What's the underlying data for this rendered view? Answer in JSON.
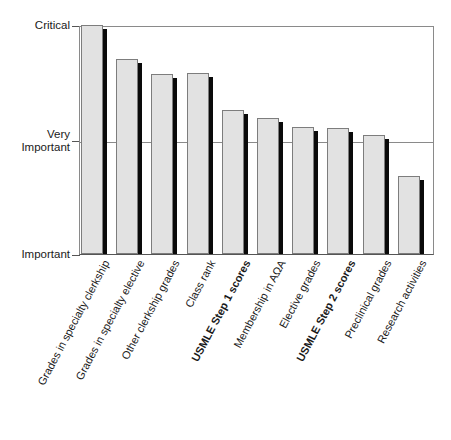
{
  "chart_data": {
    "type": "bar",
    "title": "",
    "subtitle": "",
    "xlabel": "",
    "ylabel": "",
    "grid": "horizontal-single",
    "legend": "none",
    "ylim": [
      1,
      3
    ],
    "ytick_labels": [
      "Critical",
      "Very\nImportant",
      "Important"
    ],
    "ytick_values": [
      3,
      2,
      1
    ],
    "categories": [
      "Grades in specialty clerkship",
      "Grades in specialty elective",
      "Other clerkship grades",
      "Class rank",
      "USMLE Step 1 scores",
      "Membership in AΩA",
      "Elective grades",
      "USMLE Step 2 scores",
      "Preclinical grades",
      "Research activities"
    ],
    "values": [
      3.0,
      2.7,
      2.57,
      2.56,
      2.25,
      2.19,
      2.11,
      2.1,
      2.04,
      1.68
    ],
    "bars": [
      {
        "label": "Grades in specialty clerkship",
        "value": 3.0,
        "bold": false,
        "top_px": 26,
        "height_px": 229
      },
      {
        "label": "Grades in specialty elective",
        "value": 2.7,
        "bold": false,
        "top_px": 60,
        "height_px": 195
      },
      {
        "label": "Other clerkship grades",
        "value": 2.57,
        "bold": false,
        "top_px": 75,
        "height_px": 180
      },
      {
        "label": "Class rank",
        "value": 2.56,
        "bold": false,
        "top_px": 74,
        "height_px": 181
      },
      {
        "label": "USMLE Step 1 scores",
        "value": 2.25,
        "bold": true,
        "top_px": 111,
        "height_px": 144
      },
      {
        "label": "Membership in AΩA",
        "value": 2.19,
        "bold": false,
        "top_px": 119,
        "height_px": 136
      },
      {
        "label": "Elective grades",
        "value": 2.11,
        "bold": false,
        "top_px": 128,
        "height_px": 127
      },
      {
        "label": "USMLE Step 2 scores",
        "value": 2.1,
        "bold": true,
        "top_px": 129,
        "height_px": 126
      },
      {
        "label": "Preclinical grades",
        "value": 2.04,
        "bold": false,
        "top_px": 136,
        "height_px": 119
      },
      {
        "label": "Research activities",
        "value": 1.68,
        "bold": false,
        "top_px": 177,
        "height_px": 78
      }
    ],
    "colors": {
      "bar_fill": "#e2e2e2",
      "bar_border": "#7d7d7d",
      "bar_shadow": "#0a0a0a",
      "axis": "#555555",
      "grid": "#8a8a8a",
      "background": "#ffffff",
      "text": "#1a1a1a"
    }
  },
  "axis": {
    "y": {
      "critical": "Critical",
      "very_important_line1": "Very",
      "very_important_line2": "Important",
      "important": "Important"
    }
  }
}
